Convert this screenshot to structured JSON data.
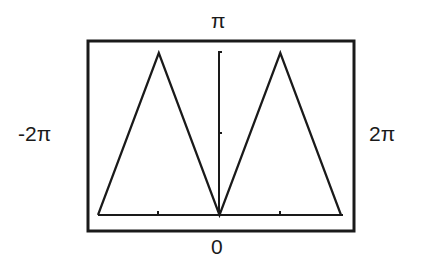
{
  "chart_data": {
    "type": "line",
    "title": "",
    "xlabel": "",
    "ylabel": "",
    "labels": {
      "top": "π",
      "bottom": "0",
      "left": "-2π",
      "right": "2π"
    },
    "xlim": [
      -6.2832,
      6.2832
    ],
    "ylim": [
      0,
      3.1416
    ],
    "x_ticks": [
      -3.1416,
      0,
      3.1416
    ],
    "y_ticks": [
      1.5708,
      3.1416
    ],
    "grid": false,
    "legend": null,
    "series": [
      {
        "name": "triangle wave",
        "x": [
          -6.2832,
          -3.1416,
          0,
          3.1416,
          6.2832
        ],
        "y": [
          0,
          3.1416,
          0,
          3.1416,
          0
        ]
      }
    ],
    "colors": {
      "line": "#1a1a1a",
      "frame": "#1a1a1a",
      "background": "#ffffff"
    }
  }
}
